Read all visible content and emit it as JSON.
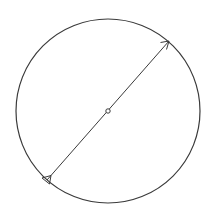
{
  "diagram": {
    "type": "circle-diameter",
    "colors": {
      "background": "#ffffff",
      "stroke": "#3a3a3a"
    },
    "circle": {
      "cx": 108,
      "cy": 111,
      "r": 92
    },
    "center_point": {
      "cx": 108,
      "cy": 111,
      "r": 2.2
    },
    "diameter": {
      "x1": 47,
      "y1": 180,
      "x2": 169,
      "y2": 41,
      "start_marker": "triangle",
      "end_marker": "open-arrow"
    }
  }
}
